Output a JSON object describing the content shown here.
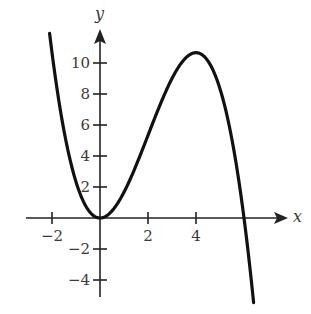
{
  "chart_data": {
    "type": "line",
    "title": "",
    "xlabel": "x",
    "ylabel": "y",
    "xlim": [
      -2.1,
      6.4
    ],
    "ylim": [
      -5,
      11
    ],
    "grid": false,
    "legend": null,
    "x_ticks": [
      -2,
      2,
      4
    ],
    "x_tick_labels": [
      "−2",
      "2",
      "4"
    ],
    "y_ticks": [
      -4,
      -2,
      2,
      4,
      6,
      8,
      10
    ],
    "y_tick_labels": [
      "−4",
      "−2",
      "2",
      "4",
      "6",
      "8",
      "10"
    ],
    "series": [
      {
        "name": "f(x)",
        "description": "cubic curve, apparent form f(x) = x^2 (6 - x) / 3",
        "x": [
          -2.1,
          -2,
          -1.5,
          -1,
          -0.5,
          0,
          0.5,
          1,
          1.5,
          2,
          2.5,
          3,
          3.5,
          4,
          4.5,
          5,
          5.5,
          6,
          6.4
        ],
        "y": [
          11.3,
          10.67,
          5.63,
          2.33,
          0.54,
          0,
          0.46,
          1.67,
          3.38,
          5.33,
          7.29,
          9.0,
          10.21,
          10.67,
          10.13,
          8.33,
          5.04,
          0,
          -5.46
        ]
      }
    ],
    "key_points": {
      "local_min": [
        0,
        0
      ],
      "local_max": [
        4,
        10.67
      ],
      "x_intercepts": [
        0,
        6
      ]
    },
    "style": {
      "curve_color": "#111111",
      "axis_color": "#222222",
      "label_color": "#3a3a3a"
    }
  }
}
